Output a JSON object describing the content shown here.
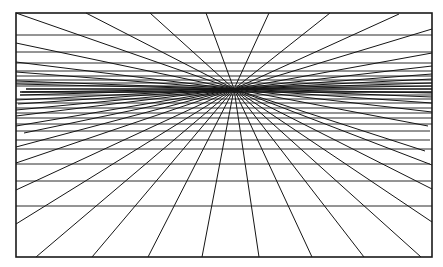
{
  "diagram": {
    "type": "one-point perspective grid",
    "frame": {
      "x1": 16,
      "y1": 13,
      "x2": 432,
      "y2": 257
    },
    "vanishing_point": {
      "x": 234,
      "y": 89
    },
    "stroke_color": "#151515",
    "background_color": "#ffffff",
    "rays": [
      {
        "x": 16,
        "y": 13
      },
      {
        "x": 86,
        "y": 13
      },
      {
        "x": 150,
        "y": 13
      },
      {
        "x": 206,
        "y": 13
      },
      {
        "x": 269,
        "y": 13
      },
      {
        "x": 330,
        "y": 13
      },
      {
        "x": 399,
        "y": 14
      },
      {
        "x": 432,
        "y": 29
      },
      {
        "x": 432,
        "y": 53
      },
      {
        "x": 432,
        "y": 66
      },
      {
        "x": 432,
        "y": 74
      },
      {
        "x": 432,
        "y": 79
      },
      {
        "x": 432,
        "y": 83
      },
      {
        "x": 432,
        "y": 86
      },
      {
        "x": 432,
        "y": 93
      },
      {
        "x": 432,
        "y": 97
      },
      {
        "x": 432,
        "y": 103
      },
      {
        "x": 432,
        "y": 112
      },
      {
        "x": 428,
        "y": 126
      },
      {
        "x": 425,
        "y": 151
      },
      {
        "x": 432,
        "y": 165
      },
      {
        "x": 432,
        "y": 189
      },
      {
        "x": 432,
        "y": 222
      },
      {
        "x": 421,
        "y": 257
      },
      {
        "x": 364,
        "y": 257
      },
      {
        "x": 312,
        "y": 257
      },
      {
        "x": 259,
        "y": 257
      },
      {
        "x": 202,
        "y": 257
      },
      {
        "x": 148,
        "y": 257
      },
      {
        "x": 92,
        "y": 257
      },
      {
        "x": 36,
        "y": 257
      },
      {
        "x": 16,
        "y": 224
      },
      {
        "x": 16,
        "y": 190
      },
      {
        "x": 16,
        "y": 163
      },
      {
        "x": 16,
        "y": 147
      },
      {
        "x": 24,
        "y": 133
      },
      {
        "x": 16,
        "y": 126
      },
      {
        "x": 16,
        "y": 116
      },
      {
        "x": 16,
        "y": 110
      },
      {
        "x": 18,
        "y": 104
      },
      {
        "x": 16,
        "y": 100
      },
      {
        "x": 20,
        "y": 95
      },
      {
        "x": 22,
        "y": 92
      },
      {
        "x": 16,
        "y": 84
      },
      {
        "x": 16,
        "y": 81
      },
      {
        "x": 16,
        "y": 72
      },
      {
        "x": 16,
        "y": 62
      },
      {
        "x": 16,
        "y": 43
      }
    ],
    "horizontals": [
      {
        "y": 35,
        "x1": 16,
        "x2": 432
      },
      {
        "y": 52,
        "x1": 16,
        "x2": 432
      },
      {
        "y": 63,
        "x1": 16,
        "x2": 432
      },
      {
        "y": 71,
        "x1": 16,
        "x2": 432
      },
      {
        "y": 76,
        "x1": 16,
        "x2": 432
      },
      {
        "y": 80,
        "x1": 16,
        "x2": 432
      },
      {
        "y": 83,
        "x1": 16,
        "x2": 432
      },
      {
        "y": 86,
        "x1": 16,
        "x2": 432
      },
      {
        "y": 89,
        "x1": 26,
        "x2": 432,
        "dense": true
      },
      {
        "y": 92,
        "x1": 20,
        "x2": 432,
        "dense": true
      },
      {
        "y": 95,
        "x1": 20,
        "x2": 432
      },
      {
        "y": 99,
        "x1": 16,
        "x2": 432
      },
      {
        "y": 103,
        "x1": 16,
        "x2": 432
      },
      {
        "y": 108,
        "x1": 16,
        "x2": 432
      },
      {
        "y": 113,
        "x1": 16,
        "x2": 432
      },
      {
        "y": 118,
        "x1": 16,
        "x2": 432
      },
      {
        "y": 124,
        "x1": 16,
        "x2": 432
      },
      {
        "y": 131,
        "x1": 16,
        "x2": 430
      },
      {
        "y": 140,
        "x1": 16,
        "x2": 430
      },
      {
        "y": 149,
        "x1": 16,
        "x2": 432
      },
      {
        "y": 164,
        "x1": 16,
        "x2": 430
      },
      {
        "y": 181,
        "x1": 16,
        "x2": 431
      },
      {
        "y": 206,
        "x1": 16,
        "x2": 432
      }
    ]
  }
}
